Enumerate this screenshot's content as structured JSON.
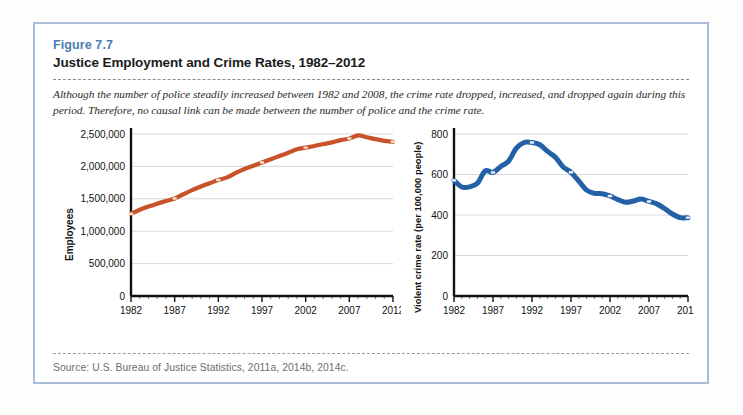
{
  "figure": {
    "number_label": "Figure 7.7",
    "title": "Justice Employment and Crime Rates, 1982–2012",
    "caption": "Although the number of police steadily increased between 1982 and 2008, the crime rate dropped, increased, and dropped again during this period. Therefore, no causal link can be made between the number of police and the crime rate.",
    "source": "Source: U.S. Bureau of Justice Statistics, 2011a, 2014b, 2014c.",
    "border_color": "#a9bcdb",
    "label_color": "#4b7cb5"
  },
  "chart_data": [
    {
      "type": "line",
      "title": "",
      "xlabel": "",
      "ylabel": "Employees",
      "series_color": "#c8522a",
      "xlim": [
        1982,
        2012
      ],
      "ylim": [
        0,
        2500000
      ],
      "grid": true,
      "legend": "none",
      "xticks": [
        1982,
        1987,
        1992,
        1997,
        2002,
        2007,
        2012
      ],
      "xtick_labels": [
        "1982",
        "1987",
        "1992",
        "1997",
        "2002",
        "2007",
        "2012"
      ],
      "yticks": [
        0,
        500000,
        1000000,
        1500000,
        2000000,
        2500000
      ],
      "ytick_labels": [
        "0",
        "500,000",
        "1,000,000",
        "1,500,000",
        "2,000,000",
        "2,500,000"
      ],
      "x": [
        1982,
        1983,
        1984,
        1985,
        1986,
        1987,
        1988,
        1989,
        1990,
        1991,
        1992,
        1993,
        1994,
        1995,
        1996,
        1997,
        1998,
        1999,
        2000,
        2001,
        2002,
        2003,
        2004,
        2005,
        2006,
        2007,
        2008,
        2009,
        2010,
        2011,
        2012
      ],
      "values": [
        1270000,
        1330000,
        1380000,
        1425000,
        1465000,
        1505000,
        1570000,
        1635000,
        1690000,
        1740000,
        1790000,
        1830000,
        1900000,
        1960000,
        2010000,
        2060000,
        2110000,
        2160000,
        2210000,
        2265000,
        2290000,
        2315000,
        2345000,
        2370000,
        2405000,
        2430000,
        2480000,
        2450000,
        2420000,
        2395000,
        2380000
      ],
      "marker_years": [
        1982,
        1987,
        1992,
        1997,
        2002,
        2007,
        2012
      ]
    },
    {
      "type": "line",
      "title": "",
      "xlabel": "",
      "ylabel": "Violent crime rate (per 100,000 people)",
      "series_color": "#2360a6",
      "xlim": [
        1982,
        2012
      ],
      "ylim": [
        0,
        800
      ],
      "grid": true,
      "legend": "none",
      "xticks": [
        1982,
        1987,
        1992,
        1997,
        2002,
        2007,
        2012
      ],
      "xtick_labels": [
        "1982",
        "1987",
        "1992",
        "1997",
        "2002",
        "2007",
        "2012"
      ],
      "yticks": [
        0,
        200,
        400,
        600,
        800
      ],
      "ytick_labels": [
        "0",
        "200",
        "400",
        "600",
        "800"
      ],
      "x": [
        1982,
        1983,
        1984,
        1985,
        1986,
        1987,
        1988,
        1989,
        1990,
        1991,
        1992,
        1993,
        1994,
        1995,
        1996,
        1997,
        1998,
        1999,
        2000,
        2001,
        2002,
        2003,
        2004,
        2005,
        2006,
        2007,
        2008,
        2009,
        2010,
        2011,
        2012
      ],
      "values": [
        571,
        538,
        539,
        557,
        618,
        610,
        640,
        666,
        730,
        758,
        758,
        747,
        714,
        685,
        637,
        611,
        568,
        523,
        507,
        505,
        494,
        476,
        463,
        469,
        479,
        467,
        455,
        432,
        405,
        387,
        387
      ],
      "marker_years": [
        1982,
        1987,
        1992,
        1997,
        2002,
        2007,
        2012
      ]
    }
  ]
}
